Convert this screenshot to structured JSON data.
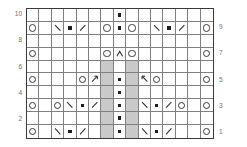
{
  "chart_data": {
    "type": "table",
    "title": "",
    "xlabel": "",
    "ylabel": "",
    "columns": 15,
    "rows": 10,
    "grid": true,
    "legend_position": "none",
    "row_labels_left": [
      "10",
      "8",
      "6",
      "4",
      "2"
    ],
    "row_labels_right": [
      "9",
      "7",
      "5",
      "3",
      "1"
    ],
    "symbol_key": {
      "blank": "knit",
      "o": "yarn-over",
      "dot": "purl",
      "bsl": "left-leaning-decrease",
      "fsl": "right-leaning-decrease",
      "up": "double-decrease",
      "arr_r": "right-arrow-decrease",
      "arr_l": "left-arrow-decrease",
      "shade": "no-stitch"
    },
    "colors": {
      "grid_line": "#808080",
      "frame": "#3a3a3a",
      "no_stitch_fill": "#c9c9c9",
      "symbol": "#2b2b2b",
      "label": "#6e6e6e",
      "background": "#ffffff"
    },
    "cells": [
      [
        "blank",
        "blank",
        "blank",
        "blank",
        "blank",
        "blank",
        "blank",
        "dot",
        "blank",
        "blank",
        "blank",
        "blank",
        "blank",
        "blank",
        "blank"
      ],
      [
        "o",
        "blank",
        "bsl",
        "dot",
        "fsl",
        "blank",
        "o",
        "dot",
        "o",
        "blank",
        "bsl",
        "dot",
        "fsl",
        "blank",
        "o"
      ],
      [
        "blank",
        "blank",
        "blank",
        "blank",
        "blank",
        "blank",
        "blank",
        "blank",
        "blank",
        "blank",
        "blank",
        "blank",
        "blank",
        "blank",
        "blank"
      ],
      [
        "o",
        "blank",
        "blank",
        "blank",
        "blank",
        "blank",
        "o",
        "up",
        "o",
        "blank",
        "blank",
        "blank",
        "blank",
        "blank",
        "o"
      ],
      [
        "blank",
        "blank",
        "blank",
        "blank",
        "blank",
        "blank",
        "shade",
        "blank",
        "shade",
        "blank",
        "blank",
        "blank",
        "blank",
        "blank",
        "blank"
      ],
      [
        "o",
        "blank",
        "blank",
        "blank",
        "o",
        "arr_r",
        "shade",
        "dot",
        "shade",
        "arr_l",
        "o",
        "blank",
        "blank",
        "blank",
        "o"
      ],
      [
        "blank",
        "blank",
        "blank",
        "blank",
        "blank",
        "blank",
        "shade",
        "dot",
        "shade",
        "blank",
        "blank",
        "blank",
        "blank",
        "blank",
        "blank"
      ],
      [
        "o",
        "blank",
        "o",
        "bsl",
        "dot",
        "fsl",
        "shade",
        "dot",
        "shade",
        "bsl",
        "dot",
        "fsl",
        "o",
        "blank",
        "o"
      ],
      [
        "blank",
        "blank",
        "blank",
        "blank",
        "blank",
        "blank",
        "shade",
        "dot",
        "shade",
        "blank",
        "blank",
        "blank",
        "blank",
        "blank",
        "blank"
      ],
      [
        "o",
        "blank",
        "bsl",
        "dot",
        "fsl",
        "blank",
        "shade",
        "dot",
        "shade",
        "bsl",
        "dot",
        "fsl",
        "blank",
        "blank",
        "o"
      ]
    ],
    "row_numbers_by_row_index": [
      "10",
      "9",
      "8",
      "7",
      "6",
      "5",
      "4",
      "3",
      "2",
      "1"
    ]
  }
}
